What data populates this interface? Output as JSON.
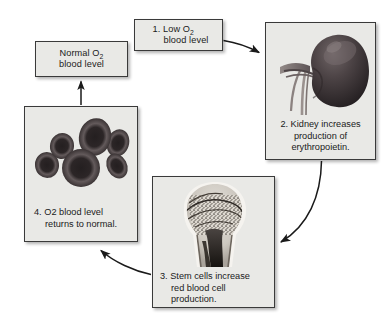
{
  "diagram": {
    "background_color": "#ffffff",
    "box_fill_color": "#e9e9e6",
    "box_border_color": "#3a3a3a",
    "text_color": "#1a1a1a"
  },
  "nodes": {
    "normal": {
      "line1_pre": "Normal O",
      "line1_sub": "2",
      "line2": "blood level"
    },
    "step1": {
      "line1_pre": "1. Low O",
      "line1_sub": "2",
      "line2": "blood level"
    },
    "step2": {
      "line1": "2. Kidney increases",
      "line2": "production of",
      "line3": "erythropoietin.",
      "image": "kidney-illustration"
    },
    "step3": {
      "line1": "3. Stem cells increase",
      "line2": "red blood cell",
      "line3": "production.",
      "image": "bone-marrow-illustration"
    },
    "step4": {
      "line1_pre": "4. O",
      "line1_sub": "2",
      "line1_post": " blood level",
      "line2": "returns to normal.",
      "image": "red-blood-cells-illustration"
    }
  },
  "arrows": [
    {
      "name": "arrow-step1-to-step2",
      "from": "step1",
      "to": "step2",
      "style": "curved"
    },
    {
      "name": "arrow-step2-to-step3",
      "from": "step2",
      "to": "step3",
      "style": "curved"
    },
    {
      "name": "arrow-step3-to-step4",
      "from": "step3",
      "to": "step4",
      "style": "curved"
    },
    {
      "name": "arrow-step4-to-normal",
      "from": "step4",
      "to": "normal",
      "style": "straight"
    }
  ]
}
